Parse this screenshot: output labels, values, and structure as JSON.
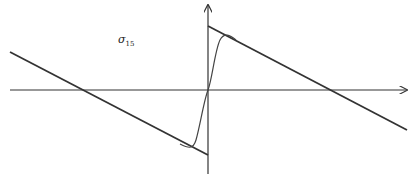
{
  "diagram": {
    "label": "σ",
    "label_subscript": "15",
    "colors": {
      "background": "#ffffff",
      "axis": "#333333",
      "line": "#333333",
      "curve": "#444444"
    },
    "axes": {
      "x_axis": {
        "from": [
          10,
          90
        ],
        "to": [
          407,
          90
        ],
        "arrow": true
      },
      "y_axis": {
        "from": [
          208,
          174
        ],
        "to": [
          208,
          5
        ],
        "arrow": true
      }
    },
    "asymptotes": [
      {
        "name": "left-line",
        "from": [
          10,
          52
        ],
        "to": [
          208,
          155
        ]
      },
      {
        "name": "right-line",
        "from": [
          208,
          26
        ],
        "to": [
          407,
          130
        ]
      }
    ],
    "zero_crossings": [
      {
        "x": 82,
        "y": 90
      },
      {
        "x": 332,
        "y": 90
      }
    ]
  }
}
